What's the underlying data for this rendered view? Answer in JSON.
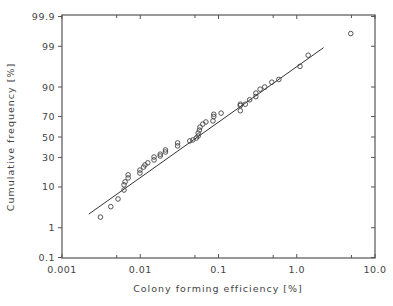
{
  "chart_data": {
    "type": "scatter",
    "title": "",
    "xlabel": "Colony forming efficiency  [%]",
    "ylabel": "Cumulative frequency  [%]",
    "x_scale": "log",
    "y_scale": "probability",
    "xlim": [
      0.001,
      10.0
    ],
    "ylim": [
      0.1,
      99.9
    ],
    "x_ticks": [
      "0.001",
      "0.01",
      "0.1",
      "1.0",
      "10.0"
    ],
    "x_tick_values": [
      0.001,
      0.01,
      0.1,
      1.0,
      10.0
    ],
    "x_minor_ticks": [
      0.005,
      0.05,
      0.5,
      5.0
    ],
    "y_ticks": [
      "0.1",
      "1",
      "10",
      "30",
      "50",
      "70",
      "90",
      "99",
      "99.9"
    ],
    "y_tick_values": [
      0.1,
      1,
      10,
      30,
      50,
      70,
      90,
      99,
      99.9
    ],
    "grid": false,
    "legend": null,
    "series": [
      {
        "name": "observations",
        "marker": "open-circle",
        "points": [
          [
            0.0031,
            2.0
          ],
          [
            0.0042,
            3.7
          ],
          [
            0.0052,
            5.6
          ],
          [
            0.0062,
            8.7
          ],
          [
            0.0062,
            11.0
          ],
          [
            0.0064,
            12.5
          ],
          [
            0.007,
            14.7
          ],
          [
            0.007,
            16.6
          ],
          [
            0.0099,
            17.8
          ],
          [
            0.0099,
            19.8
          ],
          [
            0.011,
            22.0
          ],
          [
            0.0115,
            23.7
          ],
          [
            0.0125,
            25.4
          ],
          [
            0.015,
            27.8
          ],
          [
            0.015,
            30.4
          ],
          [
            0.018,
            31.3
          ],
          [
            0.018,
            33.0
          ],
          [
            0.021,
            35.0
          ],
          [
            0.021,
            37.0
          ],
          [
            0.03,
            41.0
          ],
          [
            0.03,
            44.0
          ],
          [
            0.043,
            46.0
          ],
          [
            0.047,
            47.0
          ],
          [
            0.052,
            49.0
          ],
          [
            0.055,
            51.0
          ],
          [
            0.055,
            54.0
          ],
          [
            0.057,
            57.0
          ],
          [
            0.058,
            60.0
          ],
          [
            0.063,
            63.0
          ],
          [
            0.069,
            65.0
          ],
          [
            0.085,
            66.0
          ],
          [
            0.087,
            70.0
          ],
          [
            0.087,
            72.0
          ],
          [
            0.108,
            73.0
          ],
          [
            0.19,
            75.0
          ],
          [
            0.19,
            79.0
          ],
          [
            0.19,
            80.0
          ],
          [
            0.22,
            80.0
          ],
          [
            0.25,
            83.0
          ],
          [
            0.3,
            85.0
          ],
          [
            0.3,
            87.0
          ],
          [
            0.34,
            89.0
          ],
          [
            0.39,
            90.0
          ],
          [
            0.48,
            92.0
          ],
          [
            0.59,
            93.0
          ],
          [
            1.1,
            96.5
          ],
          [
            1.4,
            98.2
          ],
          [
            4.9,
            99.6
          ]
        ]
      },
      {
        "name": "fitted log-normal line",
        "type": "line",
        "points": [
          [
            0.0022,
            2.4
          ],
          [
            2.2,
            98.9
          ]
        ]
      }
    ]
  }
}
